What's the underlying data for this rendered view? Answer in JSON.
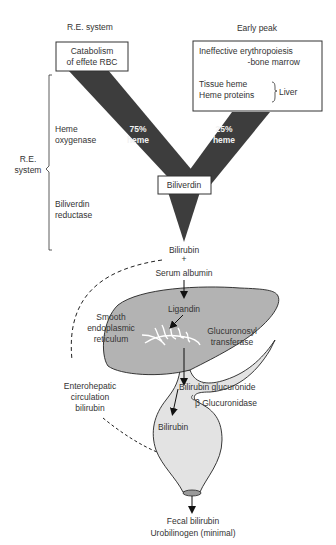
{
  "header_left": "R.E. system",
  "header_right": "Early peak",
  "source_left": [
    "Catabolism",
    "of effete RBC"
  ],
  "source_right": {
    "line1": "Ineffective erythropoiesis",
    "line2": "-bone marrow",
    "line3": "Tissue heme",
    "line4": "Heme proteins",
    "brace_label": "Liver"
  },
  "flow_left": [
    "75%",
    "heme"
  ],
  "flow_right": [
    "25%",
    "heme"
  ],
  "side_brace_label": [
    "R.E.",
    "system"
  ],
  "enzymes": {
    "heme_oxygenase": [
      "Heme",
      "oxygenase"
    ],
    "biliverdin_reductase": [
      "Biliverdin",
      "reductase"
    ]
  },
  "biliverdin": "Biliverdin",
  "bilirubin_albumin": [
    "Bilirubin",
    "+",
    "Serum albumin"
  ],
  "liver": {
    "ligandin": "Ligandin",
    "ser": [
      "Smooth",
      "endoplasmic",
      "reticulum"
    ],
    "enzyme": [
      "Glucuronosyl",
      "transferase"
    ]
  },
  "intestine": {
    "conjugate": "Bilirubin glucuronide",
    "enzyme": "β Glucuronidase",
    "product": "Bilirubin"
  },
  "enterohepatic": [
    "Enterohepatic",
    "circulation",
    "bilirubin"
  ],
  "output": [
    "Fecal bilirubin",
    "Urobilinogen (minimal)"
  ],
  "colors": {
    "flow": "#3d3d3d",
    "liver_fill": "#b3b3b3",
    "intestine_fill": "#e3e3e3",
    "outline": "#222222"
  }
}
